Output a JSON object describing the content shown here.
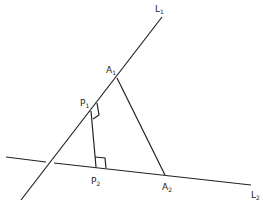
{
  "labels": {
    "L1": {
      "base": "L",
      "sub": "1"
    },
    "L2": {
      "base": "L",
      "sub": "2"
    },
    "A1": {
      "base": "A",
      "sub": "1"
    },
    "A2": {
      "base": "A",
      "sub": "2"
    },
    "P1": {
      "base": "P",
      "sub": "1"
    },
    "P2": {
      "base": "P",
      "sub": "2"
    }
  }
}
